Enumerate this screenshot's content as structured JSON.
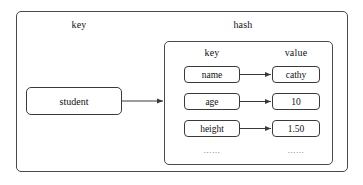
{
  "diagram": {
    "title_outer": "key",
    "title_inner": "hash",
    "outer_label": "key",
    "hash_label": "hash",
    "source_node": "student",
    "column_headers": {
      "key": "key",
      "value": "value"
    },
    "pairs": [
      {
        "key": "name",
        "value": "cathy"
      },
      {
        "key": "age",
        "value": "10"
      },
      {
        "key": "height",
        "value": "1.50"
      }
    ],
    "ellipsis": {
      "key": "……",
      "value": "……"
    },
    "colors": {
      "stroke": "#3a3a3a",
      "container_stroke": "#4a4a4a",
      "text": "#111111",
      "background": "#ffffff",
      "ellipsis_text": "#555555"
    }
  }
}
